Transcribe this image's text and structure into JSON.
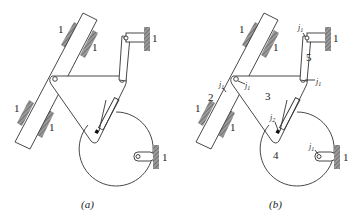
{
  "figure": {
    "panels": [
      {
        "id": "a",
        "caption": "(a)",
        "ground_labels": [
          "1",
          "1",
          "1",
          "1",
          "1",
          "1"
        ]
      },
      {
        "id": "b",
        "caption": "(b)",
        "ground_labels": [
          "1",
          "1",
          "1",
          "1",
          "1",
          "1"
        ],
        "link_labels": [
          "2",
          "3",
          "4",
          "5"
        ],
        "joint_labels": {
          "j1": "j",
          "j1_sub": "1",
          "j2": "j",
          "j2_sub": "2"
        }
      }
    ],
    "colors": {
      "line": "#333333",
      "hatch": "#777777",
      "background": "#ffffff"
    }
  }
}
